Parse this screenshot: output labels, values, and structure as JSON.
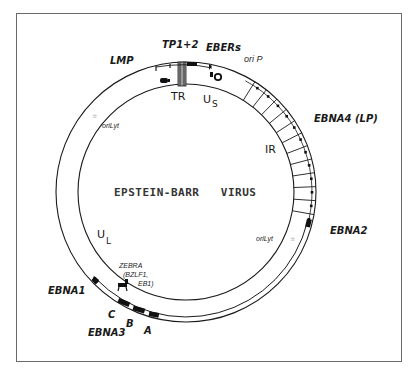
{
  "diagram": {
    "title": "EPSTEIN-BARR   VIRUS",
    "colors": {
      "line": "#1a1a1a",
      "frame": "#6a6a6a",
      "marker": "#111111",
      "tr_fill": "#9a9a9a"
    },
    "regions": {
      "tr": "TR",
      "us_main": "U",
      "us_sub": "S",
      "ir": "IR",
      "ul_main": "U",
      "ul_sub": "L"
    },
    "genes": {
      "lmp": "LMP",
      "tp": "TP1+2",
      "ebers": "EBERs",
      "orip": "ori P",
      "ebna4": "EBNA4 (LP)",
      "ebna2": "EBNA2",
      "ebna1": "EBNA1",
      "ebna3": "EBNA3",
      "ebna3_c": "C",
      "ebna3_b": "B",
      "ebna3_a": "A"
    },
    "origins": {
      "orilyt_left": "oriLyt",
      "orilyt_right": "oriLyt",
      "star": "☆"
    },
    "zebra": {
      "line1": "ZEBRA",
      "line2": "(BZLF1,",
      "line3": "EB1)"
    },
    "ir_repeat_count": 12
  }
}
